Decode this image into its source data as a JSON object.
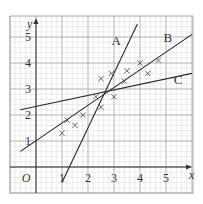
{
  "chart_data": {
    "type": "scatter",
    "title": "",
    "xlabel": "x",
    "ylabel": "y",
    "origin_label": "O",
    "xlim": [
      -1,
      6
    ],
    "ylim": [
      -1,
      6
    ],
    "x_ticks": [
      "1",
      "2",
      "3",
      "4",
      "5"
    ],
    "y_ticks": [
      "1",
      "2",
      "3",
      "4",
      "5"
    ],
    "grid": true,
    "points": [
      [
        1.0,
        1.3
      ],
      [
        1.2,
        1.8
      ],
      [
        1.5,
        1.6
      ],
      [
        1.8,
        2.0
      ],
      [
        2.3,
        2.7
      ],
      [
        2.5,
        3.4
      ],
      [
        2.5,
        2.3
      ],
      [
        2.9,
        3.6
      ],
      [
        3.0,
        2.7
      ],
      [
        3.4,
        3.3
      ],
      [
        3.5,
        3.7
      ],
      [
        4.0,
        4.0
      ],
      [
        4.3,
        3.6
      ],
      [
        4.7,
        4.1
      ]
    ],
    "lines": [
      {
        "name": "A",
        "from": [
          1.0,
          -0.6
        ],
        "to": [
          3.9,
          5.5
        ],
        "label_at": [
          2.9,
          4.7
        ]
      },
      {
        "name": "B",
        "from": [
          -0.6,
          0.6
        ],
        "to": [
          6.0,
          5.1
        ],
        "label_at": [
          4.9,
          4.8
        ]
      },
      {
        "name": "C",
        "from": [
          -0.6,
          2.2
        ],
        "to": [
          6.0,
          3.6
        ],
        "label_at": [
          5.3,
          3.2
        ]
      }
    ]
  },
  "colors": {
    "grid_minor": "#d8d8d8",
    "grid_major": "#a8a8a8",
    "axis": "#333333",
    "line": "#2a2a2a",
    "marker": "#555555",
    "text": "#333333"
  }
}
